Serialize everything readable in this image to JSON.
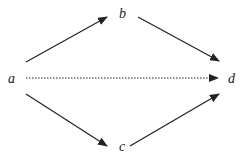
{
  "diagram": {
    "type": "directed-graph",
    "nodes": [
      {
        "id": "a",
        "label": "a",
        "x": 11,
        "y": 79
      },
      {
        "id": "b",
        "label": "b",
        "x": 123,
        "y": 15
      },
      {
        "id": "c",
        "label": "c",
        "x": 123,
        "y": 147
      },
      {
        "id": "d",
        "label": "d",
        "x": 232,
        "y": 79
      }
    ],
    "edges": [
      {
        "from": "a",
        "to": "b",
        "style": "solid"
      },
      {
        "from": "b",
        "to": "d",
        "style": "solid"
      },
      {
        "from": "a",
        "to": "d",
        "style": "dotted"
      },
      {
        "from": "a",
        "to": "c",
        "style": "solid"
      },
      {
        "from": "c",
        "to": "d",
        "style": "solid"
      }
    ],
    "colors": {
      "line": "#222222",
      "background": "#ffffff"
    }
  }
}
